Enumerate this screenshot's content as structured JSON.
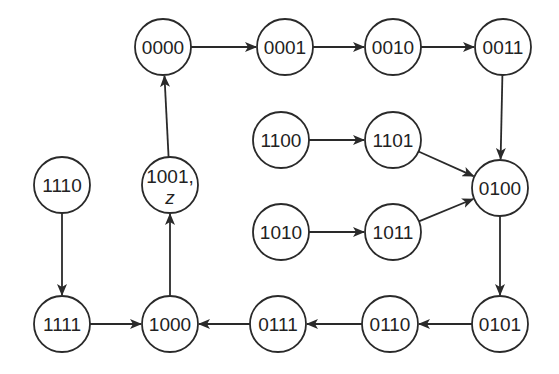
{
  "diagram": {
    "type": "state-transition",
    "nodes": [
      {
        "id": "0000",
        "label": "0000",
        "x": 163,
        "y": 47
      },
      {
        "id": "0001",
        "label": "0001",
        "x": 285,
        "y": 47
      },
      {
        "id": "0010",
        "label": "0010",
        "x": 393,
        "y": 47
      },
      {
        "id": "0011",
        "label": "0011",
        "x": 503,
        "y": 47
      },
      {
        "id": "1100",
        "label": "1100",
        "x": 281,
        "y": 140
      },
      {
        "id": "1101",
        "label": "1101",
        "x": 393,
        "y": 140
      },
      {
        "id": "0100",
        "label": "0100",
        "x": 500,
        "y": 188
      },
      {
        "id": "1110",
        "label": "1110",
        "x": 62,
        "y": 185
      },
      {
        "id": "1001",
        "label": "1001,",
        "sublabel": "z",
        "x": 170,
        "y": 185
      },
      {
        "id": "1010",
        "label": "1010",
        "x": 281,
        "y": 232
      },
      {
        "id": "1011",
        "label": "1011",
        "x": 393,
        "y": 232
      },
      {
        "id": "1111",
        "label": "1111",
        "x": 62,
        "y": 324
      },
      {
        "id": "1000",
        "label": "1000",
        "x": 170,
        "y": 324
      },
      {
        "id": "0111",
        "label": "0111",
        "x": 278,
        "y": 324
      },
      {
        "id": "0110",
        "label": "0110",
        "x": 390,
        "y": 324
      },
      {
        "id": "0101",
        "label": "0101",
        "x": 500,
        "y": 324
      }
    ],
    "edges": [
      {
        "from": "0000",
        "to": "0001"
      },
      {
        "from": "0001",
        "to": "0010"
      },
      {
        "from": "0010",
        "to": "0011"
      },
      {
        "from": "0011",
        "to": "0100"
      },
      {
        "from": "1100",
        "to": "1101"
      },
      {
        "from": "1101",
        "to": "0100"
      },
      {
        "from": "1010",
        "to": "1011"
      },
      {
        "from": "1011",
        "to": "0100"
      },
      {
        "from": "0100",
        "to": "0101"
      },
      {
        "from": "0101",
        "to": "0110"
      },
      {
        "from": "0110",
        "to": "0111"
      },
      {
        "from": "0111",
        "to": "1000"
      },
      {
        "from": "1111",
        "to": "1000"
      },
      {
        "from": "1110",
        "to": "1111"
      },
      {
        "from": "1000",
        "to": "1001"
      },
      {
        "from": "1001",
        "to": "0000"
      }
    ],
    "node_radius": 28,
    "stroke_color": "#2a2a2a"
  }
}
